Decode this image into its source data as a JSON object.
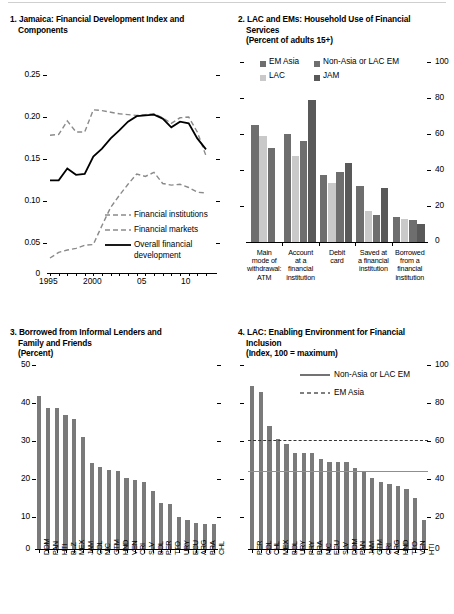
{
  "figure": {
    "panels": [
      {
        "id": "panel1",
        "number": "1.",
        "title_line1": "Jamaica: Financial Development Index and",
        "title_line2": "Components"
      },
      {
        "id": "panel2",
        "number": "2.",
        "title_line1": "LAC and EMs: Household Use of Financial",
        "title_line2": "Services",
        "subtitle": "(Percent of adults 15+)"
      },
      {
        "id": "panel3",
        "number": "3.",
        "title_line1": "Borrowed from Informal Lenders and",
        "title_line2": "Family and Friends",
        "subtitle": "(Percent)"
      },
      {
        "id": "panel4",
        "number": "4.",
        "title_line1": "LAC: Enabling Environment for Financial",
        "title_line2": "Inclusion",
        "subtitle": "(Index, 100 = maximum)"
      }
    ]
  },
  "colors": {
    "dark_gray": "#595959",
    "mid_gray": "#6e6e6e",
    "light_gray": "#c9c9c9",
    "bar_gray": "#7a7a7a",
    "black": "#000000",
    "hline": "#9a9a9a"
  },
  "chart_data": [
    {
      "type": "line",
      "panel": "1",
      "title": "Jamaica: Financial Development Index and Components",
      "xlabel": "",
      "ylabel": "",
      "ylim": [
        0,
        0.27
      ],
      "yticks": [
        0,
        0.05,
        0.1,
        0.15,
        0.2,
        0.25
      ],
      "ytick_labels": [
        "0",
        "0.05",
        "0.10",
        "0.15",
        "0.20",
        "0.25"
      ],
      "x": [
        1995,
        1996,
        1997,
        1998,
        1999,
        2000,
        2001,
        2002,
        2003,
        2004,
        2005,
        2006,
        2007,
        2008,
        2009,
        2010,
        2011,
        2012,
        2013
      ],
      "xtick_labels": [
        "1995",
        "2000",
        "05",
        "10"
      ],
      "grid": false,
      "legend_position": "inside-lower-right",
      "series": [
        {
          "name": "Financial institutions",
          "style": "dashed-light",
          "values": [
            0.174,
            0.175,
            0.192,
            0.178,
            0.178,
            0.206,
            0.205,
            0.203,
            0.201,
            0.2,
            0.199,
            0.2,
            0.201,
            0.196,
            0.189,
            0.196,
            0.197,
            0.178,
            0.148
          ]
        },
        {
          "name": "Financial markets",
          "style": "dashed-light",
          "values": [
            0.019,
            0.026,
            0.029,
            0.031,
            0.035,
            0.036,
            0.06,
            0.083,
            0.098,
            0.112,
            0.125,
            0.122,
            0.127,
            0.113,
            0.111,
            0.112,
            0.108,
            0.102,
            0.101
          ]
        },
        {
          "name": "Overall financial development",
          "style": "solid-black",
          "values": [
            0.117,
            0.117,
            0.132,
            0.124,
            0.125,
            0.147,
            0.157,
            0.17,
            0.18,
            0.191,
            0.198,
            0.199,
            0.2,
            0.195,
            0.184,
            0.191,
            0.189,
            0.17,
            0.156
          ]
        }
      ]
    },
    {
      "type": "bar",
      "panel": "2",
      "title": "LAC and EMs: Household Use of Financial Services",
      "subtitle": "(Percent of adults 15+)",
      "ylabel": "",
      "ylim": [
        0,
        100
      ],
      "yticks": [
        0,
        20,
        40,
        60,
        80,
        100
      ],
      "ytick_labels": [
        "0",
        "20",
        "40",
        "60",
        "80",
        "100"
      ],
      "grid": false,
      "legend_position": "top",
      "categories": [
        "Main mode of withdrawal: ATM",
        "Account at a financial institution",
        "Debit card",
        "Saved at a financial institution",
        "Borrowed from a financial institution"
      ],
      "category_lines": [
        [
          "Main",
          "mode of",
          "withdrawal:",
          "ATM"
        ],
        [
          "Account",
          "at a",
          "financial",
          "institution"
        ],
        [
          "Debit",
          "card"
        ],
        [
          "Saved at",
          "a financial",
          "institution"
        ],
        [
          "Borrowed",
          "from a",
          "financial",
          "institution"
        ]
      ],
      "series": [
        {
          "name": "EM Asia",
          "color": "#6e6e6e",
          "values": [
            65,
            60,
            37,
            31,
            14
          ]
        },
        {
          "name": "LAC",
          "color": "#c9c9c9",
          "values": [
            59,
            48,
            33,
            17,
            13
          ]
        },
        {
          "name": "Non-Asia or LAC EM",
          "color": "#6e6e6e",
          "values": [
            52,
            56,
            39,
            15,
            12
          ]
        },
        {
          "name": "JAM",
          "color": "#595959",
          "values": [
            null,
            79,
            44,
            30,
            10
          ]
        }
      ]
    },
    {
      "type": "bar",
      "panel": "3",
      "title": "Borrowed from Informal Lenders and Family and Friends",
      "subtitle": "(Percent)",
      "ylim": [
        0,
        52
      ],
      "yticks": [
        0,
        10,
        20,
        30,
        40,
        50
      ],
      "ytick_labels": [
        "0",
        "10",
        "20",
        "30",
        "40",
        "50"
      ],
      "grid": false,
      "color": "#7a7a7a",
      "categories": [
        "DOM",
        "PAN",
        "HTI",
        "BLZ",
        "MEX",
        "JAM",
        "COL",
        "NIC",
        "GTM",
        "HND",
        "VEN",
        "CRI",
        "SLV",
        "BOL",
        "PER",
        "TTO",
        "URY",
        "ECU",
        "ARG",
        "BRA",
        "CHL"
      ],
      "values": [
        42.3,
        39.1,
        39.0,
        37.0,
        36.0,
        31.0,
        23.8,
        22.8,
        21.8,
        21.6,
        19.6,
        19.0,
        18.6,
        16.0,
        12.8,
        12.5,
        8.9,
        7.9,
        7.2,
        7.0,
        6.8
      ]
    },
    {
      "type": "bar",
      "panel": "4",
      "title": "LAC: Enabling Environment for Financial Inclusion",
      "subtitle": "(Index, 100 = maximum)",
      "ylim": [
        0,
        105
      ],
      "yticks": [
        0,
        20,
        40,
        60,
        80,
        100
      ],
      "ytick_labels": [
        "0",
        "20",
        "40",
        "60",
        "80",
        "100"
      ],
      "grid": false,
      "legend_position": "top",
      "color": "#7a7a7a",
      "categories": [
        "PER",
        "COL",
        "CHL",
        "MEX",
        "BOL",
        "URY",
        "PRY",
        "BRA",
        "NIC",
        "ECU",
        "SLV",
        "DOM",
        "PAN",
        "JAM",
        "GTM",
        "CRI",
        "ARG",
        "HND",
        "TTO",
        "VEN",
        "HTI"
      ],
      "values": [
        90,
        87,
        68,
        61,
        58,
        53,
        53,
        53,
        50,
        48,
        48,
        48,
        45,
        43,
        39,
        37,
        36,
        35,
        33,
        28,
        16
      ],
      "reference_lines": [
        {
          "name": "Non-Asia or LAC EM",
          "style": "solid",
          "value": 43
        },
        {
          "name": "EM Asia",
          "style": "dashed",
          "value": 60
        }
      ]
    }
  ]
}
